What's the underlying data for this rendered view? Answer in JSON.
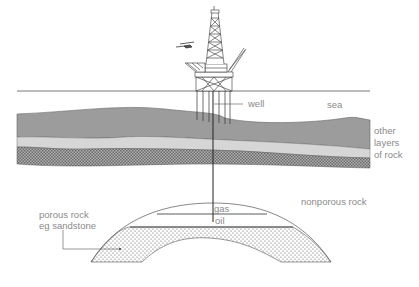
{
  "diagram": {
    "labels": {
      "well": "well",
      "sea": "sea",
      "other_layers_1": "other",
      "other_layers_2": "layers",
      "other_layers_3": "of rock",
      "nonporous": "nonporous rock",
      "porous_1": "porous rock",
      "porous_2": "eg sandstone",
      "gas": "gas",
      "oil": "oil"
    },
    "colors": {
      "sea_line": "#444444",
      "layer_dark": "#9a9a9a",
      "layer_light": "#d4d4d4",
      "layer_hatched": "#8c8c8c",
      "line": "#333333",
      "label": "#8a8a8a"
    },
    "icons": [
      "oil-platform-icon",
      "helicopter-icon"
    ]
  }
}
